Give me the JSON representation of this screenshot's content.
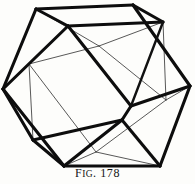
{
  "figure": {
    "caption_prefix": "F",
    "caption_small": "IG",
    "caption_suffix": ". 178",
    "caption_full": "FIG. 178",
    "number": "178",
    "background_color": "#fdfdfb",
    "visible_edge_color": "#0d0d0d",
    "hidden_edge_color": "#3a3a3a"
  },
  "geometry": {
    "type": "wireframe-polyhedron",
    "view": "orthographic-oblique",
    "width": 195,
    "height": 184,
    "vertices": {
      "outer_top_left": [
        36,
        9
      ],
      "outer_top_right": [
        133,
        5
      ],
      "outer_right": [
        190,
        86
      ],
      "outer_bottom_right": [
        160,
        166
      ],
      "outer_bottom_left": [
        64,
        166
      ],
      "outer_left": [
        3,
        89
      ],
      "inner_upper_left": [
        68,
        26
      ],
      "inner_upper_right": [
        163,
        22
      ],
      "inner_mid_right": [
        131,
        106
      ],
      "inner_lower_right": [
        122,
        120
      ],
      "inner_lower_left": [
        33,
        140
      ],
      "inner_mid_left": [
        57,
        60
      ],
      "inner_back_top": [
        99,
        46
      ],
      "inner_back_left": [
        29,
        64
      ],
      "inner_back_bottom": [
        96,
        152
      ],
      "inner_back_right": [
        166,
        100
      ]
    },
    "visible_edges": [
      [
        "outer_top_left",
        "outer_top_right"
      ],
      [
        "outer_top_right",
        "outer_right"
      ],
      [
        "outer_right",
        "outer_bottom_right"
      ],
      [
        "outer_bottom_right",
        "outer_bottom_left"
      ],
      [
        "outer_bottom_left",
        "outer_left"
      ],
      [
        "outer_left",
        "outer_top_left"
      ],
      [
        "outer_top_left",
        "inner_upper_left"
      ],
      [
        "inner_upper_left",
        "inner_upper_right"
      ],
      [
        "inner_upper_right",
        "outer_top_right"
      ],
      [
        "inner_upper_left",
        "outer_left"
      ],
      [
        "inner_upper_left",
        "inner_mid_right"
      ],
      [
        "inner_mid_right",
        "outer_right"
      ],
      [
        "inner_mid_right",
        "inner_lower_right"
      ],
      [
        "inner_lower_right",
        "outer_bottom_right"
      ],
      [
        "inner_lower_right",
        "inner_lower_left"
      ],
      [
        "inner_lower_left",
        "outer_left"
      ],
      [
        "inner_lower_left",
        "outer_bottom_left"
      ],
      [
        "inner_lower_right",
        "outer_bottom_left"
      ],
      [
        "inner_upper_right",
        "inner_mid_right"
      ]
    ],
    "hidden_edges": [
      [
        "outer_top_left",
        "inner_back_top"
      ],
      [
        "inner_back_top",
        "inner_upper_right"
      ],
      [
        "inner_back_top",
        "inner_back_left"
      ],
      [
        "inner_back_left",
        "outer_left"
      ],
      [
        "inner_back_left",
        "inner_back_bottom"
      ],
      [
        "inner_back_bottom",
        "outer_bottom_left"
      ],
      [
        "inner_back_bottom",
        "inner_back_right"
      ],
      [
        "inner_back_right",
        "outer_right"
      ],
      [
        "inner_back_top",
        "inner_back_right"
      ],
      [
        "inner_back_bottom",
        "outer_bottom_right"
      ],
      [
        "inner_mid_left",
        "inner_back_top"
      ],
      [
        "inner_back_left",
        "inner_mid_right"
      ]
    ]
  }
}
